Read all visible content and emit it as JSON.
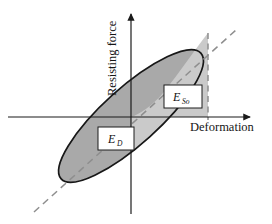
{
  "figure": {
    "name": "hysteresis-loop-energy-diagram",
    "background_color": "#ffffff",
    "width": 272,
    "height": 224
  },
  "axes": {
    "x_label": "Deformation",
    "y_label": "Resisting force",
    "origin": {
      "x": 131,
      "y": 117
    },
    "x_axis": {
      "x1": 8,
      "y1": 117,
      "x2": 252,
      "y2": 117,
      "arrow": true
    },
    "y_axis": {
      "x1": 131,
      "y1": 214,
      "x2": 131,
      "y2": 12,
      "arrow": true
    },
    "color": "#1b1b1b"
  },
  "labels": {
    "dissipated": {
      "base": "E",
      "sub": "D",
      "x": 112,
      "y": 140
    },
    "stored": {
      "base": "E",
      "sub": "So",
      "x": 178,
      "y": 99
    }
  },
  "shapes": {
    "ellipse": {
      "name": "hysteresis-loop",
      "center_x": 131,
      "center_y": 116,
      "semi_major": 94,
      "semi_minor": 28,
      "rotation_deg": -42,
      "fill": "#a9a9a9",
      "stroke": "#171717",
      "stroke_width": 1.6
    },
    "stored_energy_region": {
      "name": "stored-energy-triangle",
      "fill": "#cacaca",
      "stroke": "none"
    },
    "secant_line": {
      "name": "secant-dashed-line",
      "x1": 34,
      "y1": 212,
      "x2": 236,
      "y2": 30,
      "stroke": "#8e8e8e",
      "dash": "7 5",
      "stroke_width": 1.4
    },
    "peak_drop_line": {
      "name": "peak-deformation-dashed-line",
      "x1": 208,
      "y1": 33,
      "x2": 208,
      "y2": 120,
      "stroke": "#8e8e8e",
      "dash": "6 4.5",
      "stroke_width": 1.4
    }
  },
  "colors": {
    "loop_fill_dark": "#a9a9a9",
    "loop_fill_light": "#cacaca",
    "stroke_dark": "#171717",
    "dashed_gray": "#8e8e8e",
    "label_box_fill": "#ffffff",
    "label_box_stroke": "#1d1d1d",
    "background": "#ffffff"
  }
}
